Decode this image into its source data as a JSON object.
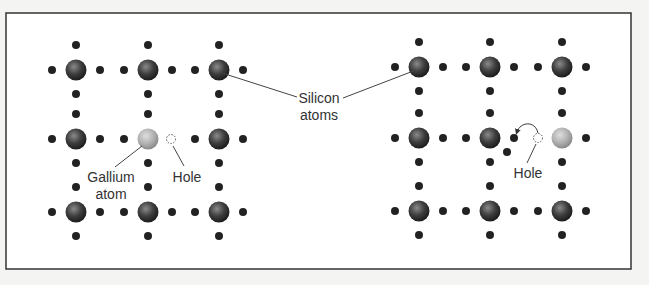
{
  "labels": {
    "silicon_line1": "Silicon",
    "silicon_line2": "atoms",
    "gallium_line1": "Gallium",
    "gallium_line2": "atom",
    "hole_left": "Hole",
    "hole_right": "Hole"
  },
  "colors": {
    "background": "#ffffff",
    "border": "#333333",
    "silicon_atom": "#3a3a3a",
    "gallium_atom": "#b0b0b0",
    "electron": "#222222",
    "leader_line": "#444444"
  },
  "lattices": [
    {
      "name": "left-lattice",
      "columns": [
        76,
        148,
        219
      ],
      "rows": [
        70,
        139,
        212
      ],
      "gallium": [
        1,
        1
      ],
      "holes": [
        [
          171,
          139
        ]
      ]
    },
    {
      "name": "right-lattice",
      "columns": [
        419,
        490,
        562
      ],
      "rows": [
        67,
        138,
        211
      ],
      "gallium": [
        2,
        1
      ],
      "holes": [
        [
          538,
          138
        ]
      ]
    }
  ]
}
